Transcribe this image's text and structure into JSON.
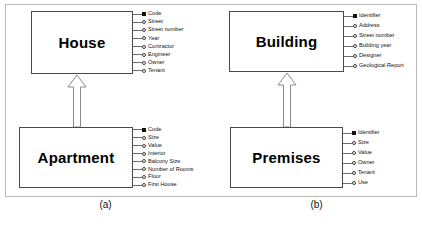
{
  "diagram": {
    "type": "uml-generalization",
    "panels": [
      {
        "caption": "(a)",
        "superclass": {
          "name": "House",
          "attributes": [
            {
              "label": "Code",
              "key": true
            },
            {
              "label": "Street",
              "key": false
            },
            {
              "label": "Street number",
              "key": false
            },
            {
              "label": "Year",
              "key": false
            },
            {
              "label": "Contractor",
              "key": false
            },
            {
              "label": "Engineer",
              "key": false
            },
            {
              "label": "Owner",
              "key": false
            },
            {
              "label": "Tenant",
              "key": false
            }
          ]
        },
        "subclass": {
          "name": "Apartment",
          "attributes": [
            {
              "label": "Code",
              "key": true
            },
            {
              "label": "Size",
              "key": false
            },
            {
              "label": "Value",
              "key": false
            },
            {
              "label": "Interior",
              "key": false
            },
            {
              "label": "Balcony Size",
              "key": false
            },
            {
              "label": "Number of Rooms",
              "key": false
            },
            {
              "label": "Floor",
              "key": false
            },
            {
              "label": "First House",
              "key": false
            }
          ]
        }
      },
      {
        "caption": "(b)",
        "superclass": {
          "name": "Building",
          "attributes": [
            {
              "label": "Identifier",
              "key": true
            },
            {
              "label": "Address",
              "key": false
            },
            {
              "label": "Street number",
              "key": false
            },
            {
              "label": "Building year",
              "key": false
            },
            {
              "label": "Designer",
              "key": false
            },
            {
              "label": "Geological Report",
              "key": false
            }
          ]
        },
        "subclass": {
          "name": "Premises",
          "attributes": [
            {
              "label": "Identifier",
              "key": true
            },
            {
              "label": "Size",
              "key": false
            },
            {
              "label": "Value",
              "key": false
            },
            {
              "label": "Owner",
              "key": false
            },
            {
              "label": "Tenant",
              "key": false
            },
            {
              "label": "Use",
              "key": false
            }
          ]
        }
      }
    ],
    "colors": {
      "box_border": "#4a4a4a",
      "frame_border": "#b9b9b9",
      "text": "#111111",
      "key_marker": "#111111",
      "arrow_stroke": "#8a8a8a"
    }
  }
}
